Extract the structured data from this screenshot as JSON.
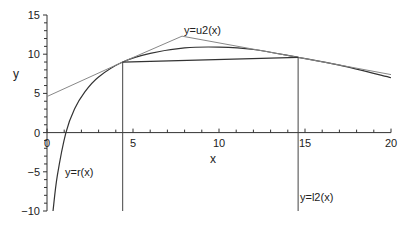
{
  "chart_data": {
    "type": "line",
    "title": "",
    "xlabel": "x",
    "ylabel": "y",
    "xlim": [
      0,
      20
    ],
    "ylim": [
      -10,
      15
    ],
    "xticks": [
      0,
      5,
      10,
      15,
      20
    ],
    "yticks": [
      -10,
      -5,
      0,
      5,
      10,
      15
    ],
    "grid": false,
    "legend": null,
    "series": [
      {
        "name": "r(x)",
        "kind": "curve",
        "x": [
          0.35,
          0.6,
          1.1,
          1.6,
          2.2,
          3.0,
          4.4,
          6.0,
          8.0,
          10.0,
          12.0,
          14.6,
          17.0,
          20.0
        ],
        "y": [
          -10.0,
          -5.5,
          0.0,
          3.0,
          5.2,
          7.1,
          9.0,
          10.1,
          10.8,
          10.9,
          10.6,
          9.6,
          8.6,
          7.0
        ]
      },
      {
        "name": "u2(x)",
        "kind": "tangent-polyline",
        "x": [
          0.0,
          4.4,
          7.85,
          14.6,
          20.0
        ],
        "y": [
          4.6,
          9.0,
          12.3,
          9.6,
          7.4
        ]
      },
      {
        "name": "secant",
        "kind": "line",
        "x": [
          4.4,
          14.6
        ],
        "y": [
          9.0,
          9.6
        ]
      },
      {
        "name": "l2(x)",
        "kind": "vertical-lines",
        "x": [
          4.4,
          14.6
        ],
        "y_from": -10,
        "y_to_values": [
          9.0,
          9.6
        ]
      }
    ],
    "annotations": [
      {
        "text": "y=u2(x)",
        "x": 7.7,
        "y": 13.0
      },
      {
        "text": "y=r(x)",
        "x": 0.9,
        "y": -5.0
      },
      {
        "text": "y=l2(x)",
        "x": 14.7,
        "y": -9.0
      }
    ]
  },
  "labels": {
    "xlabel": "x",
    "ylabel": "y",
    "annot_u2": "y=u2(x)",
    "annot_r": "y=r(x)",
    "annot_l2": "y=l2(x)"
  }
}
